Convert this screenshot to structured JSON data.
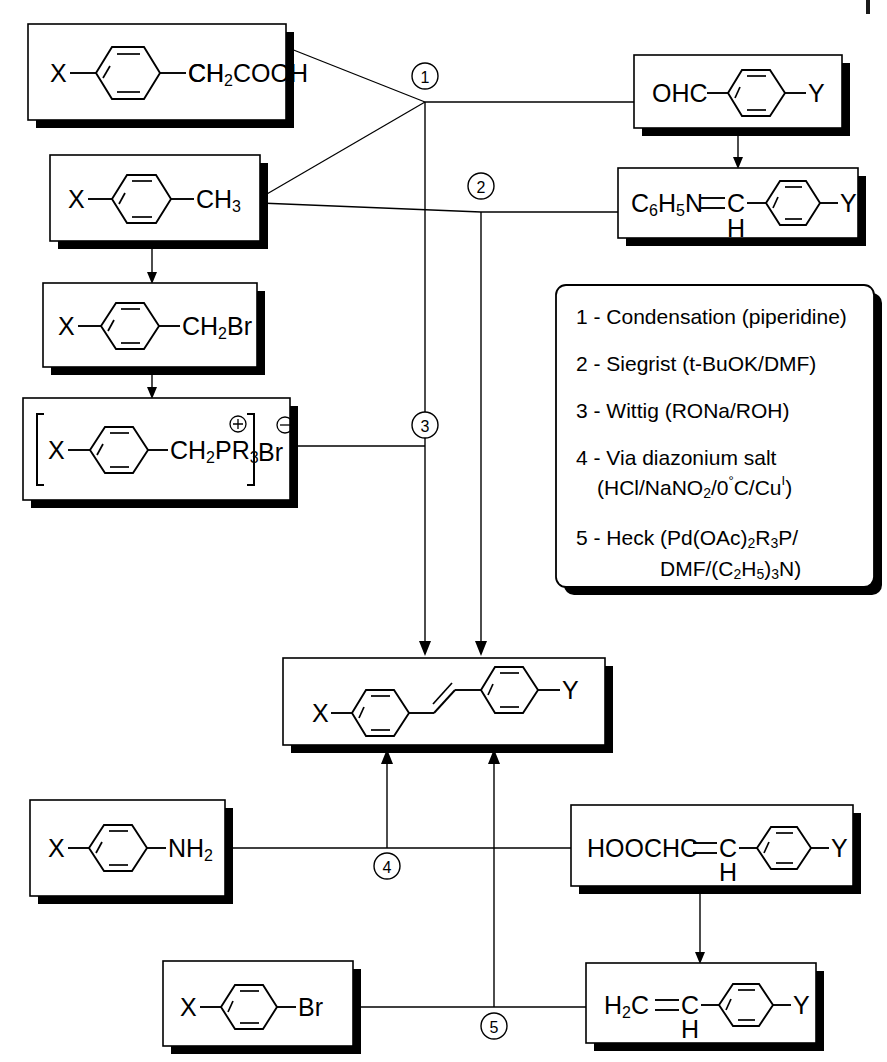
{
  "diagram": {
    "substituent_left": "X",
    "substituent_right": "Y"
  },
  "colors": {
    "line": "#000000",
    "box_fill": "#ffffff",
    "shadow": "#000000",
    "background": "#ffffff"
  },
  "boxes": {
    "phenylacetic_acid": {
      "id": "phenylacetic-acid",
      "left_label": "X",
      "right_label": "CH",
      "right_sub": "2",
      "right_tail": "COOH",
      "x": 28,
      "y": 24,
      "w": 258,
      "h": 96
    },
    "toluene": {
      "id": "toluene",
      "left_label": "X",
      "right_label": "CH",
      "right_sub": "3",
      "x": 50,
      "y": 155,
      "w": 210,
      "h": 86
    },
    "benzyl_bromide": {
      "id": "benzyl-bromide",
      "left_label": "X",
      "right_label": "CH",
      "right_sub": "2",
      "right_tail": "Br",
      "x": 43,
      "y": 283,
      "w": 214,
      "h": 84
    },
    "phosphonium_salt": {
      "id": "phosphonium-salt",
      "left_label": "X",
      "right_label": "CH",
      "right_sub": "2",
      "right_tail": "PR",
      "right_tail_sub": "3",
      "counter_ion": "Br",
      "cation_charge": "+",
      "anion_charge": "-",
      "x": 23,
      "y": 398,
      "w": 267,
      "h": 102
    },
    "benzaldehyde": {
      "id": "benzaldehyde",
      "left_label": "OHC",
      "right_label": "Y",
      "x": 634,
      "y": 55,
      "w": 208,
      "h": 73
    },
    "anil": {
      "id": "benzylidene-aniline",
      "left_label": "C",
      "left_sub1": "6",
      "left_mid": "H",
      "left_sub2": "5",
      "left_tail": "N",
      "double_bond": "=",
      "carbon": "C",
      "carbon_h": "H",
      "right_label": "Y",
      "x": 618,
      "y": 168,
      "w": 240,
      "h": 70
    },
    "stilbene": {
      "id": "stilbene-product",
      "left_label": "X",
      "right_label": "Y",
      "x": 283,
      "y": 658,
      "w": 322,
      "h": 87
    },
    "aniline": {
      "id": "aniline",
      "left_label": "X",
      "right_label": "NH",
      "right_sub": "2",
      "x": 30,
      "y": 800,
      "w": 195,
      "h": 96
    },
    "cinnamic_acid": {
      "id": "cinnamic-acid",
      "left_label": "HOOCHC",
      "double_bond": "=",
      "carbon": "C",
      "carbon_h": "H",
      "right_label": "Y",
      "x": 571,
      "y": 805,
      "w": 282,
      "h": 81
    },
    "aryl_bromide": {
      "id": "aryl-bromide",
      "left_label": "X",
      "right_label": "Br",
      "x": 163,
      "y": 961,
      "w": 190,
      "h": 85
    },
    "styrene": {
      "id": "styrene",
      "left_label": "H",
      "left_sub": "2",
      "left_mid": "C",
      "double_bond": "=",
      "carbon": "C",
      "carbon_h": "H",
      "right_label": "Y",
      "x": 586,
      "y": 963,
      "w": 230,
      "h": 80
    }
  },
  "markers": [
    {
      "id": "marker-1",
      "label": "1",
      "cx": 425,
      "cy": 76
    },
    {
      "id": "marker-2",
      "label": "2",
      "cx": 481,
      "cy": 186
    },
    {
      "id": "marker-3",
      "label": "3",
      "cx": 425,
      "cy": 425
    },
    {
      "id": "marker-4",
      "label": "4",
      "cx": 387,
      "cy": 856
    },
    {
      "id": "marker-5",
      "label": "5",
      "cx": 494,
      "cy": 1026
    }
  ],
  "legend": {
    "id": "reaction-legend",
    "x": 556,
    "y": 285,
    "w": 318,
    "h": 302,
    "items": [
      {
        "num": "1",
        "dash": "-",
        "text": "Condensation (piperidine)"
      },
      {
        "num": "2",
        "dash": "-",
        "text": "Siegrist (t-BuOK/DMF)"
      },
      {
        "num": "3",
        "dash": "-",
        "text": "Wittig (RONa/ROH)"
      },
      {
        "num": "4",
        "dash": "-",
        "text": "Via diazonium salt",
        "line2": "(HCl/NaNO2/0°C/CuI)"
      },
      {
        "num": "5",
        "dash": "-",
        "text": "Heck (Pd(OAc)2R3P/",
        "line2": "DMF/(C2H5)3N)"
      }
    ],
    "entries_plain": [
      "1 - Condensation (piperidine)",
      "2 - Siegrist (t-BuOK/DMF)",
      "3 - Wittig (RONa/ROH)",
      "4 - Via diazonium salt (HCl/NaNO2/0°C/CuI)",
      "5 - Heck (Pd(OAc)2R3P/ DMF/(C2H5)3N)"
    ]
  },
  "reactions": {
    "1": {
      "name": "Condensation",
      "reagents": "piperidine",
      "from": [
        "phenylacetic-acid",
        "benzaldehyde"
      ],
      "to": "stilbene-product"
    },
    "2": {
      "name": "Siegrist",
      "reagents": "t-BuOK/DMF",
      "from": [
        "toluene",
        "benzylidene-aniline"
      ],
      "to": "stilbene-product"
    },
    "3": {
      "name": "Wittig",
      "reagents": "RONa/ROH",
      "from": [
        "phosphonium-salt"
      ],
      "to": "stilbene-product"
    },
    "4": {
      "name": "Via diazonium salt",
      "reagents": "HCl/NaNO2/0°C/CuI",
      "from": [
        "aniline",
        "cinnamic-acid"
      ],
      "to": "stilbene-product"
    },
    "5": {
      "name": "Heck",
      "reagents": "Pd(OAc)2R3P/DMF/(C2H5)3N",
      "from": [
        "aryl-bromide",
        "styrene"
      ],
      "to": "stilbene-product"
    }
  }
}
